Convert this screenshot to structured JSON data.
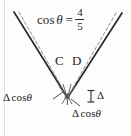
{
  "figure": {
    "background_color": "#fdfdfd",
    "ink_color": "#232323",
    "dashed_color": "#8c8c8c"
  },
  "formula": {
    "function_name": "cos",
    "angle_symbol": "θ",
    "equals": "=",
    "numerator": "4",
    "denominator": "5",
    "full_text": "cos θ = 4/5"
  },
  "point_labels": {
    "c": "C",
    "d": "D"
  },
  "annotations": {
    "left_delta_cos": {
      "delta": "Δ",
      "cos": "cos",
      "theta": "θ",
      "full_text": "Δ cos θ"
    },
    "right_delta": {
      "delta": "Δ",
      "full_text": "Δ"
    },
    "bottom_delta_cos": {
      "delta": "Δ",
      "cos": "cos",
      "theta": "θ",
      "full_text": "Δ cos θ"
    }
  },
  "geometry": {
    "vertex": {
      "x": 67,
      "y": 97
    },
    "left_arm_top": {
      "x": 14,
      "y": 12
    },
    "right_arm_top": {
      "x": 122,
      "y": 13
    },
    "bracket": {
      "x": 91,
      "y": 90,
      "height": 12
    }
  }
}
